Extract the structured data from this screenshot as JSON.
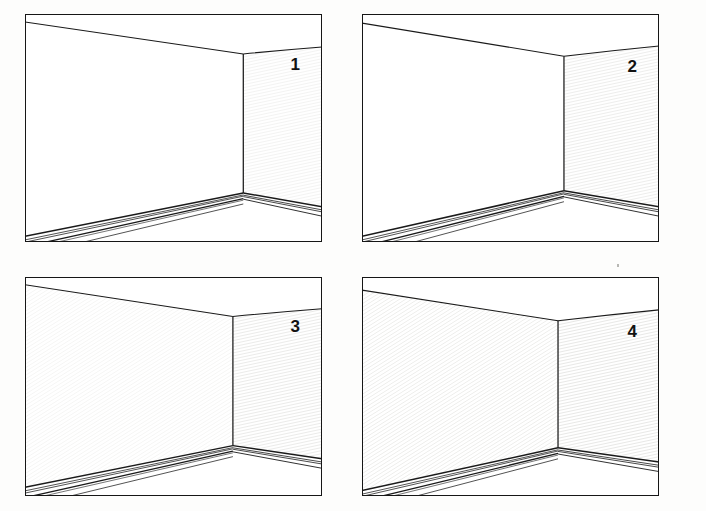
{
  "figure": {
    "kind": "line-drawing-figure",
    "background_color": "#fdfdfc",
    "panel_background": "#ffffff",
    "line_color": "#1a1a1a",
    "border_color": "#161616",
    "hatch_color": "#d6d6d2",
    "label_color": "#121212",
    "columns": 2,
    "rows": 2
  },
  "panels": [
    {
      "id": "panel-1",
      "label": "1",
      "x": 25,
      "y": 14,
      "w": 297,
      "h": 228,
      "corner_x": 0.735,
      "corner_top_y": 0.175,
      "corner_bottom_y": 0.785,
      "ceiling_left_y": 0.035,
      "ceiling_right_y": 0.145,
      "floor_left_y": 0.975,
      "floor_right_y": 0.845,
      "left_wall_shaded": false,
      "right_wall_shaded": true,
      "right_wall_shade_opacity": 0.42,
      "left_wall_shade_opacity": 0.0,
      "extra_floor_line": false
    },
    {
      "id": "panel-2",
      "label": "2",
      "x": 362,
      "y": 14,
      "w": 297,
      "h": 228,
      "corner_x": 0.68,
      "corner_top_y": 0.185,
      "corner_bottom_y": 0.775,
      "ceiling_left_y": 0.04,
      "ceiling_right_y": 0.14,
      "floor_left_y": 0.975,
      "floor_right_y": 0.845,
      "left_wall_shaded": false,
      "right_wall_shaded": true,
      "right_wall_shade_opacity": 0.62,
      "left_wall_shade_opacity": 0.0,
      "extra_floor_line": false
    },
    {
      "id": "panel-3",
      "label": "3",
      "x": 25,
      "y": 277,
      "w": 297,
      "h": 219,
      "corner_x": 0.7,
      "corner_top_y": 0.18,
      "corner_bottom_y": 0.77,
      "ceiling_left_y": 0.035,
      "ceiling_right_y": 0.145,
      "floor_left_y": 0.96,
      "floor_right_y": 0.83,
      "left_wall_shaded": true,
      "right_wall_shaded": true,
      "right_wall_shade_opacity": 0.7,
      "left_wall_shade_opacity": 0.3,
      "extra_floor_line": true
    },
    {
      "id": "panel-4",
      "label": "4",
      "x": 362,
      "y": 277,
      "w": 297,
      "h": 219,
      "corner_x": 0.66,
      "corner_top_y": 0.2,
      "corner_bottom_y": 0.78,
      "ceiling_left_y": 0.06,
      "ceiling_right_y": 0.15,
      "floor_left_y": 0.975,
      "floor_right_y": 0.845,
      "left_wall_shaded": true,
      "right_wall_shaded": true,
      "right_wall_shade_opacity": 0.8,
      "left_wall_shade_opacity": 0.55,
      "extra_floor_line": true
    }
  ],
  "labels": {
    "panel_1": "1",
    "panel_2": "2",
    "panel_3": "3",
    "panel_4": "4"
  },
  "artifacts": {
    "speck_note": "small ink speck above panel 4 upper area",
    "speck_x": 617,
    "speck_y": 264
  }
}
